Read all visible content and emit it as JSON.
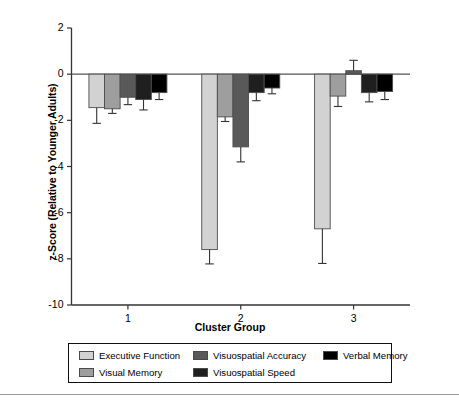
{
  "chart_data": {
    "type": "bar",
    "title": "",
    "xlabel": "Cluster Group",
    "ylabel": "z-Score (Relative to Younger Adults)",
    "categories": [
      "1",
      "2",
      "3"
    ],
    "ylim": [
      -10,
      2
    ],
    "yticks": [
      2,
      0,
      -2,
      -4,
      -6,
      -8,
      -10
    ],
    "ytick_labels": [
      "2",
      "0",
      "-2",
      "-4",
      "-6",
      "-8",
      "-10"
    ],
    "grid": false,
    "legend_position": "below-axes",
    "zero_line": true,
    "series": [
      {
        "name": "Executive Function",
        "color": "#d2d2d2",
        "values": [
          -1.45,
          -7.6,
          -6.7
        ],
        "errors": [
          0.68,
          0.62,
          1.5
        ]
      },
      {
        "name": "Visual Memory",
        "color": "#9e9e9e",
        "values": [
          -1.5,
          -1.85,
          -0.95
        ],
        "errors": [
          0.2,
          0.2,
          0.45
        ]
      },
      {
        "name": "Visuospatial Accuracy",
        "color": "#595959",
        "values": [
          -1.0,
          -3.15,
          0.15
        ],
        "errors": [
          0.32,
          0.65,
          0.45
        ]
      },
      {
        "name": "Visuospatial Speed",
        "color": "#1f1f1f",
        "values": [
          -1.1,
          -0.8,
          -0.8
        ],
        "errors": [
          0.45,
          0.35,
          0.4
        ]
      },
      {
        "name": "Verbal Memory",
        "color": "#000000",
        "values": [
          -0.8,
          -0.6,
          -0.75
        ],
        "errors": [
          0.3,
          0.25,
          0.35
        ]
      }
    ]
  },
  "legend": {
    "entries": [
      {
        "label": "Executive Function",
        "color": "#d2d2d2"
      },
      {
        "label": "Visual Memory",
        "color": "#9e9e9e"
      },
      {
        "label": "Visuospatial Accuracy",
        "color": "#595959"
      },
      {
        "label": "Visuospatial Speed",
        "color": "#1f1f1f"
      },
      {
        "label": "Verbal Memory",
        "color": "#000000"
      }
    ]
  },
  "axes": {
    "x_title": "Cluster Group",
    "y_title": "z-Score (Relative to Younger Adults)"
  }
}
